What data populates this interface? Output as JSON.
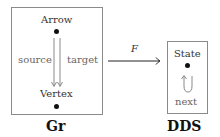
{
  "gr": {
    "title": "Gr",
    "nodes": [
      {
        "label": "Arrow"
      },
      {
        "label": "Vertex"
      }
    ],
    "edges": [
      {
        "label": "source"
      },
      {
        "label": "target"
      }
    ]
  },
  "functor": {
    "label": "F"
  },
  "dds": {
    "title": "DDS",
    "nodes": [
      {
        "label": "State"
      }
    ],
    "edges": [
      {
        "label": "next"
      }
    ]
  },
  "colors": {
    "box_border": "#8a8a8a",
    "arrow_gray": "#8a8a8a",
    "functor_arrow": "#222222",
    "dot": "#111111"
  }
}
